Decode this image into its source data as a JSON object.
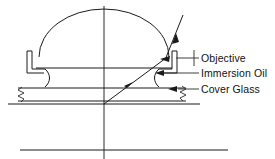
{
  "figure": {
    "type": "optical-schematic",
    "background_color": "#ffffff",
    "line_color": "#1a1a1a",
    "text_color": "#111111"
  },
  "labels": [
    {
      "id": "objective",
      "text": "Objective",
      "text_x": 201,
      "text_y": 62,
      "leader_from_x": 199,
      "leader_from_y": 58,
      "leader_to_x": 176,
      "leader_to_y": 58,
      "pointer": "tick"
    },
    {
      "id": "immersion-oil",
      "text": "Immersion Oil",
      "text_x": 201,
      "text_y": 77,
      "leader_from_x": 199,
      "leader_from_y": 73,
      "leader_to_x": 159,
      "leader_to_y": 73,
      "pointer": "arrow"
    },
    {
      "id": "cover-glass",
      "text": "Cover Glass",
      "text_x": 201,
      "text_y": 93,
      "leader_from_x": 199,
      "leader_from_y": 89,
      "leader_to_x": 163,
      "leader_to_y": 89,
      "pointer": "arrow"
    }
  ],
  "components": {
    "front_lens": {
      "name": "hemispherical front lens element",
      "center_x": 104,
      "base_y": 57,
      "radius_x": 65,
      "radius_y": 48
    },
    "oil_layer": {
      "name": "immersion oil layer",
      "top_y": 68,
      "bottom_y": 86,
      "left_x": 36,
      "right_x": 172
    },
    "cover_glass": {
      "name": "cover glass slip",
      "top_y": 88,
      "bottom_y": 101,
      "left_x": 18,
      "right_x": 186
    },
    "slide_surface": {
      "name": "specimen slide surface",
      "y": 104,
      "left_x": 8,
      "right_x": 200
    },
    "lower_line": {
      "name": "lower boundary line",
      "y": 150,
      "left_x": 20,
      "right_x": 228
    },
    "optical_axis": {
      "name": "optical axis",
      "x": 104,
      "top_y": 6,
      "bottom_y": 159
    },
    "specimen_point": {
      "name": "specimen point source",
      "x": 104,
      "y": 104
    }
  },
  "rays": {
    "marginal_ray": {
      "name": "marginal ray from specimen through oil and lens",
      "start_x": 104,
      "start_y": 104,
      "end_x": 166,
      "end_y": 58,
      "arrow_at_x": 129,
      "arrow_at_y": 85
    },
    "exit_ray": {
      "name": "ray refracted exiting objective",
      "start_x": 166,
      "start_y": 58,
      "end_x": 182,
      "end_y": 16,
      "arrow_at_x": 174,
      "arrow_at_y": 36
    }
  },
  "break_symbols": [
    {
      "id": "left-break",
      "x": 22,
      "y_top": 88,
      "y_bottom": 102
    },
    {
      "id": "right-break",
      "x": 182,
      "y_top": 87,
      "y_bottom": 101
    }
  ]
}
